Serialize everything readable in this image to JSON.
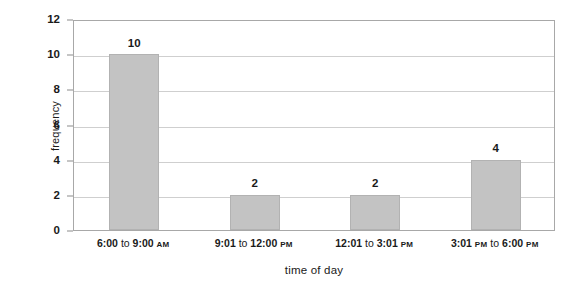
{
  "chart_data": {
    "type": "bar",
    "title": "",
    "xlabel": "time of day",
    "ylabel": "frequency",
    "categories": [
      "6:00 to 9:00 AM",
      "9:01 to 12:00 PM",
      "12:01 to 3:01 PM",
      "3:01 PM to 6:00 PM"
    ],
    "category_parts": [
      {
        "time": "6:00 to 9:00",
        "suffix": "AM",
        "prefix": ""
      },
      {
        "time": "9:01 to 12:00",
        "suffix": "PM",
        "prefix": ""
      },
      {
        "time": "12:01 to 3:01",
        "suffix": "PM",
        "prefix": ""
      },
      {
        "time": "3:01",
        "mid": "PM to",
        "time2": "6:00",
        "suffix": "PM",
        "prefix": ""
      }
    ],
    "values": [
      10,
      2,
      2,
      4
    ],
    "value_labels": [
      "10",
      "2",
      "2",
      "4"
    ],
    "ylim": [
      0,
      12
    ],
    "ytick_values": [
      0,
      2,
      4,
      6,
      8,
      10,
      12
    ],
    "ytick_labels": [
      "0",
      "2",
      "4",
      "6",
      "8",
      "10",
      "12"
    ],
    "grid": true,
    "legend": false,
    "bar_color": "#c3c3c3",
    "bar_border_color": "#b2b2b2",
    "gridline_color": "#cfcfcf",
    "axis_color": "#a8a8a8",
    "text_color": "#1a1a1a",
    "background": "#ffffff"
  }
}
